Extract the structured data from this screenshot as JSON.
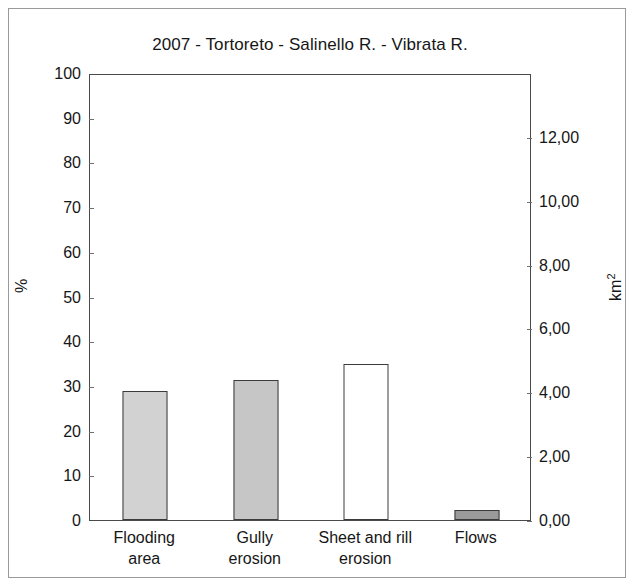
{
  "chart_data": {
    "type": "bar",
    "title": "2007 - Tortoreto - Salinello R. - Vibrata R.",
    "categories": [
      "Flooding area",
      "Gully erosion",
      "Sheet and rill erosion",
      "Flows"
    ],
    "category_lines": [
      [
        "Flooding",
        "area"
      ],
      [
        "Gully",
        "erosion"
      ],
      [
        "Sheet and rill",
        "erosion"
      ],
      [
        "Flows",
        ""
      ]
    ],
    "values": [
      28.9,
      31.4,
      35.0,
      2.3
    ],
    "values_km2": [
      4.04,
      4.39,
      4.9,
      0.32
    ],
    "bar_colors": [
      "#d2d2d2",
      "#c6c6c6",
      "#ffffff",
      "#9a9a9a"
    ],
    "bar_border_color": "#3b3b3b",
    "xlabel": "",
    "ylabel": "%",
    "ylabel_right": "km",
    "ylabel_right_sup": "2",
    "ylim": [
      0,
      100
    ],
    "ylim_right": [
      0,
      14
    ],
    "yticks": [
      0,
      10,
      20,
      30,
      40,
      50,
      60,
      70,
      80,
      90,
      100
    ],
    "ytick_labels": [
      "0",
      "10",
      "20",
      "30",
      "40",
      "50",
      "60",
      "70",
      "80",
      "90",
      "100"
    ],
    "yticks_right": [
      0,
      2,
      4,
      6,
      8,
      10,
      12
    ],
    "ytick_labels_right": [
      "0,00",
      "2,00",
      "4,00",
      "6,00",
      "8,00",
      "10,00",
      "12,00"
    ],
    "grid": false,
    "legend": "none"
  }
}
